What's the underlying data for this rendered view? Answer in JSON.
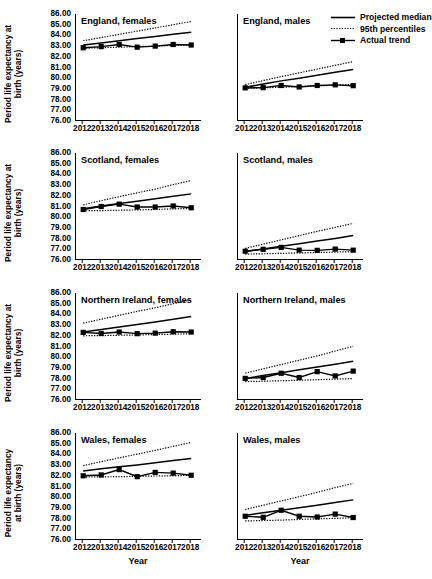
{
  "figure": {
    "y_axis_title_line1": "Period life expectancy at",
    "y_axis_title_line2": "birth (years)",
    "y_axis_title_wales_line1": "Period life expectancy",
    "y_axis_title_wales_line2": "at birth (years)",
    "x_axis_label": "Year"
  },
  "legend": {
    "items": [
      {
        "label": "Projected median",
        "style": "solid",
        "color": "#000000"
      },
      {
        "label": "95th percentiles",
        "style": "dotted",
        "color": "#000000"
      },
      {
        "label": "Actual trend",
        "style": "solid-marker",
        "color": "#000000"
      }
    ]
  },
  "chart_data": {
    "type": "line",
    "title": "",
    "xlabel": "Year",
    "ylabel": "Period life expectancy at birth (years)",
    "x": [
      2012,
      2013,
      2014,
      2015,
      2016,
      2017,
      2018
    ],
    "xlim": [
      2011.6,
      2018.6
    ],
    "ylim": [
      76.0,
      86.0
    ],
    "ytick_labels": [
      "86.00",
      "85.00",
      "84.00",
      "83.00",
      "82.00",
      "81.00",
      "80.00",
      "79.00",
      "78.00",
      "77.00",
      "76.00"
    ],
    "ytick_values": [
      86,
      85,
      84,
      83,
      82,
      81,
      80,
      79,
      78,
      77,
      76
    ],
    "xtick_labels": [
      "2012",
      "2013",
      "2014",
      "2015",
      "2016",
      "2017",
      "2018"
    ],
    "grid": false,
    "legend_position": "top-right",
    "panels": [
      {
        "title": "England, females",
        "series": [
          {
            "name": "Projected median",
            "style": "solid",
            "values": [
              83.1,
              83.3,
              83.5,
              83.7,
              83.9,
              84.1,
              84.3
            ]
          },
          {
            "name": "95th percentiles upper",
            "style": "dotted",
            "values": [
              83.5,
              83.8,
              84.1,
              84.4,
              84.7,
              85.0,
              85.3
            ]
          },
          {
            "name": "95th percentiles lower",
            "style": "dotted",
            "values": [
              82.8,
              82.85,
              82.9,
              82.95,
              83.0,
              83.05,
              83.1
            ]
          },
          {
            "name": "Actual trend",
            "style": "solid-marker",
            "values": [
              82.85,
              82.95,
              83.15,
              82.9,
              83.0,
              83.15,
              83.1
            ]
          }
        ]
      },
      {
        "title": "England, males",
        "series": [
          {
            "name": "Projected median",
            "style": "solid",
            "values": [
              79.15,
              79.45,
              79.75,
              80.0,
              80.28,
              80.55,
              80.82
            ]
          },
          {
            "name": "95th percentiles upper",
            "style": "dotted",
            "values": [
              79.4,
              79.78,
              80.15,
              80.5,
              80.85,
              81.2,
              81.55
            ]
          },
          {
            "name": "95th percentiles lower",
            "style": "dotted",
            "values": [
              79.05,
              79.1,
              79.15,
              79.22,
              79.28,
              79.35,
              79.42
            ]
          },
          {
            "name": "Actual trend",
            "style": "solid-marker",
            "values": [
              79.1,
              79.12,
              79.32,
              79.18,
              79.32,
              79.38,
              79.3
            ]
          }
        ]
      },
      {
        "title": "Scotland, females",
        "series": [
          {
            "name": "Projected median",
            "style": "solid",
            "values": [
              80.8,
              81.05,
              81.28,
              81.5,
              81.72,
              81.95,
              82.18
            ]
          },
          {
            "name": "95th percentiles upper",
            "style": "dotted",
            "values": [
              81.15,
              81.55,
              81.92,
              82.28,
              82.62,
              83.05,
              83.42
            ]
          },
          {
            "name": "95th percentiles lower",
            "style": "dotted",
            "values": [
              80.6,
              80.62,
              80.65,
              80.68,
              80.72,
              80.78,
              80.82
            ]
          },
          {
            "name": "Actual trend",
            "style": "solid-marker",
            "values": [
              80.72,
              81.0,
              81.22,
              80.95,
              80.95,
              81.05,
              80.88
            ]
          }
        ]
      },
      {
        "title": "Scotland, males",
        "series": [
          {
            "name": "Projected median",
            "style": "solid",
            "values": [
              76.8,
              77.02,
              77.28,
              77.52,
              77.78,
              78.02,
              78.28
            ]
          },
          {
            "name": "95th percentiles upper",
            "style": "dotted",
            "values": [
              77.08,
              77.48,
              77.88,
              78.28,
              78.68,
              79.05,
              79.42
            ]
          },
          {
            "name": "95th percentiles lower",
            "style": "dotted",
            "values": [
              76.55,
              76.58,
              76.62,
              76.66,
              76.7,
              76.74,
              76.78
            ]
          },
          {
            "name": "Actual trend",
            "style": "solid-marker",
            "values": [
              76.82,
              77.0,
              77.18,
              76.92,
              76.9,
              77.02,
              76.92
            ]
          }
        ]
      },
      {
        "title": "Northern Ireland, females",
        "series": [
          {
            "name": "Projected median",
            "style": "solid",
            "values": [
              82.35,
              82.58,
              82.82,
              83.05,
              83.3,
              83.55,
              83.8
            ]
          },
          {
            "name": "95th percentiles upper",
            "style": "dotted",
            "values": [
              83.18,
              83.55,
              83.92,
              84.28,
              84.62,
              85.0,
              85.35
            ]
          },
          {
            "name": "95th percentiles lower",
            "style": "dotted",
            "values": [
              82.0,
              82.02,
              82.05,
              82.08,
              82.12,
              82.15,
              82.2
            ]
          },
          {
            "name": "Actual trend",
            "style": "solid-marker",
            "values": [
              82.32,
              82.22,
              82.35,
              82.2,
              82.25,
              82.38,
              82.35
            ]
          }
        ]
      },
      {
        "title": "Northern Ireland, males",
        "series": [
          {
            "name": "Projected median",
            "style": "solid",
            "values": [
              78.02,
              78.28,
              78.55,
              78.82,
              79.08,
              79.35,
              79.62
            ]
          },
          {
            "name": "95th percentiles upper",
            "style": "dotted",
            "values": [
              78.5,
              78.92,
              79.32,
              79.72,
              80.12,
              80.58,
              81.02
            ]
          },
          {
            "name": "95th percentiles lower",
            "style": "dotted",
            "values": [
              77.72,
              77.76,
              77.8,
              77.85,
              77.9,
              77.95,
              78.0
            ]
          },
          {
            "name": "Actual trend",
            "style": "solid-marker",
            "values": [
              78.02,
              78.1,
              78.5,
              78.1,
              78.65,
              78.25,
              78.7
            ]
          }
        ]
      },
      {
        "title": "Wales, females",
        "series": [
          {
            "name": "Projected median",
            "style": "solid",
            "values": [
              82.45,
              82.65,
              82.85,
              83.02,
              83.22,
              83.42,
              83.62
            ]
          },
          {
            "name": "95th percentiles upper",
            "style": "dotted",
            "values": [
              82.95,
              83.32,
              83.68,
              84.02,
              84.38,
              84.75,
              85.12
            ]
          },
          {
            "name": "95th percentiles lower",
            "style": "dotted",
            "values": [
              81.88,
              81.9,
              81.92,
              81.95,
              81.98,
              82.0,
              82.05
            ]
          },
          {
            "name": "Actual trend",
            "style": "solid-marker",
            "values": [
              82.0,
              82.08,
              82.58,
              81.92,
              82.32,
              82.25,
              82.05
            ]
          }
        ]
      },
      {
        "title": "Wales, males",
        "series": [
          {
            "name": "Projected median",
            "style": "solid",
            "values": [
              78.3,
              78.55,
              78.78,
              79.02,
              79.25,
              79.5,
              79.75
            ]
          },
          {
            "name": "95th percentiles upper",
            "style": "dotted",
            "values": [
              78.85,
              79.25,
              79.65,
              80.05,
              80.45,
              80.9,
              81.3
            ]
          },
          {
            "name": "95th percentiles lower",
            "style": "dotted",
            "values": [
              77.78,
              77.82,
              77.86,
              77.92,
              77.98,
              78.02,
              78.08
            ]
          },
          {
            "name": "Actual trend",
            "style": "solid-marker",
            "values": [
              78.22,
              78.12,
              78.78,
              78.22,
              78.15,
              78.42,
              78.1
            ]
          }
        ]
      }
    ]
  }
}
